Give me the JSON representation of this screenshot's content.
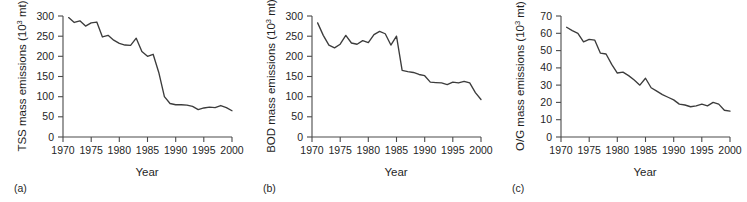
{
  "figure": {
    "panel_count": 3,
    "line_color": "#3c3c3c",
    "axis_color": "#4a4a4a",
    "background": "#ffffff"
  },
  "panels": [
    {
      "letter": "(a)",
      "ylabel_main": "TSS mass emissions (10",
      "ylabel_sup": "3",
      "ylabel_tail": " mt)",
      "xlabel": "Year",
      "ytick_labels": [
        "0",
        "50",
        "100",
        "150",
        "200",
        "250",
        "300"
      ],
      "xtick_labels": [
        "1970",
        "1975",
        "1980",
        "1985",
        "1990",
        "1995",
        "2000"
      ]
    },
    {
      "letter": "(b)",
      "ylabel_main": "BOD mass emissions (10",
      "ylabel_sup": "3",
      "ylabel_tail": " mt)",
      "xlabel": "Year",
      "ytick_labels": [
        "0",
        "50",
        "100",
        "150",
        "200",
        "250",
        "300"
      ],
      "xtick_labels": [
        "1970",
        "1975",
        "1980",
        "1985",
        "1990",
        "1995",
        "2000"
      ]
    },
    {
      "letter": "(c)",
      "ylabel_main": "O/G mass emissions (10",
      "ylabel_sup": "3",
      "ylabel_tail": " mt)",
      "xlabel": "Year",
      "ytick_labels": [
        "0",
        "10",
        "20",
        "30",
        "40",
        "50",
        "60",
        "70"
      ],
      "xtick_labels": [
        "1970",
        "1975",
        "1980",
        "1985",
        "1990",
        "1995",
        "2000"
      ]
    }
  ],
  "chart_data": [
    {
      "type": "line",
      "panel": "(a)",
      "title": "",
      "xlabel": "Year",
      "ylabel": "TSS mass emissions (10^3 mt)",
      "xlim": [
        1970,
        2000
      ],
      "ylim": [
        0,
        300
      ],
      "yticks": [
        0,
        50,
        100,
        150,
        200,
        250,
        300
      ],
      "xticks": [
        1970,
        1975,
        1980,
        1985,
        1990,
        1995,
        2000
      ],
      "grid": false,
      "legend": "none",
      "x": [
        1971,
        1972,
        1973,
        1974,
        1975,
        1976,
        1977,
        1978,
        1979,
        1980,
        1981,
        1982,
        1983,
        1984,
        1985,
        1986,
        1987,
        1988,
        1989,
        1990,
        1991,
        1992,
        1993,
        1994,
        1995,
        1996,
        1997,
        1998,
        1999,
        2000
      ],
      "y": [
        296,
        284,
        288,
        275,
        283,
        285,
        248,
        252,
        240,
        232,
        228,
        227,
        245,
        212,
        200,
        205,
        160,
        100,
        83,
        80,
        80,
        79,
        76,
        68,
        72,
        74,
        73,
        78,
        73,
        65
      ]
    },
    {
      "type": "line",
      "panel": "(b)",
      "title": "",
      "xlabel": "Year",
      "ylabel": "BOD mass emissions (10^3 mt)",
      "xlim": [
        1970,
        2000
      ],
      "ylim": [
        0,
        300
      ],
      "yticks": [
        0,
        50,
        100,
        150,
        200,
        250,
        300
      ],
      "xticks": [
        1970,
        1975,
        1980,
        1985,
        1990,
        1995,
        2000
      ],
      "grid": false,
      "legend": "none",
      "x": [
        1971,
        1972,
        1973,
        1974,
        1975,
        1976,
        1977,
        1978,
        1979,
        1980,
        1981,
        1982,
        1983,
        1984,
        1985,
        1986,
        1987,
        1988,
        1989,
        1990,
        1991,
        1992,
        1993,
        1994,
        1995,
        1996,
        1997,
        1998,
        1999,
        2000
      ],
      "y": [
        283,
        252,
        228,
        221,
        230,
        252,
        233,
        230,
        239,
        234,
        254,
        262,
        256,
        228,
        250,
        165,
        162,
        160,
        155,
        152,
        136,
        135,
        134,
        130,
        136,
        134,
        138,
        134,
        110,
        93
      ]
    },
    {
      "type": "line",
      "panel": "(c)",
      "title": "",
      "xlabel": "Year",
      "ylabel": "O/G mass emissions (10^3 mt)",
      "xlim": [
        1970,
        2000
      ],
      "ylim": [
        0,
        70
      ],
      "yticks": [
        0,
        10,
        20,
        30,
        40,
        50,
        60,
        70
      ],
      "xticks": [
        1970,
        1975,
        1980,
        1985,
        1990,
        1995,
        2000
      ],
      "grid": false,
      "legend": "none",
      "x": [
        1971,
        1972,
        1973,
        1974,
        1975,
        1976,
        1977,
        1978,
        1979,
        1980,
        1981,
        1982,
        1983,
        1984,
        1985,
        1986,
        1987,
        1988,
        1989,
        1990,
        1991,
        1992,
        1993,
        1994,
        1995,
        1996,
        1997,
        1998,
        1999,
        2000
      ],
      "y": [
        63.5,
        61.5,
        60.0,
        55.0,
        56.5,
        56.0,
        48.5,
        48.0,
        42.0,
        37.0,
        37.5,
        35.5,
        33.0,
        30.0,
        34.0,
        28.5,
        26.5,
        24.5,
        23.0,
        21.5,
        19.0,
        18.5,
        17.5,
        18.0,
        19.0,
        18.0,
        20.0,
        19.0,
        15.5,
        15.0
      ]
    }
  ]
}
